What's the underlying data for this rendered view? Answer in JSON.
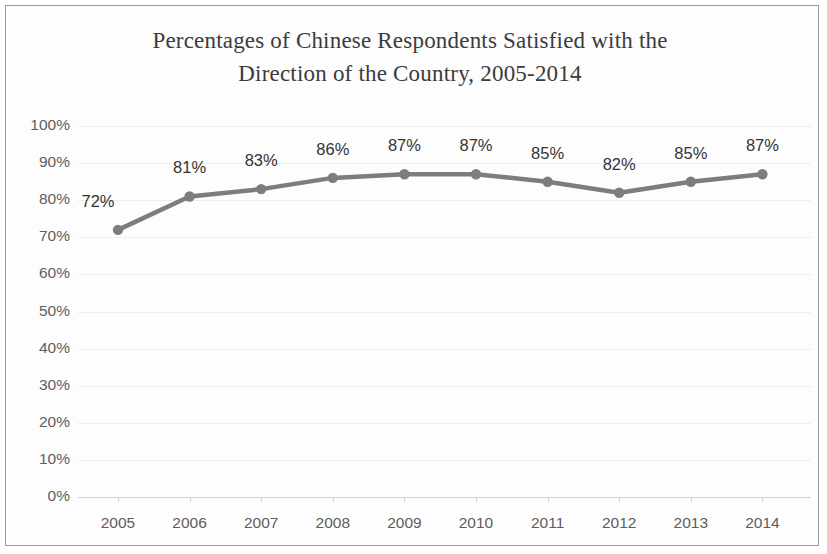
{
  "chart_data": {
    "type": "line",
    "title": "Percentages of Chinese Respondents Satisfied with the Direction of the Country, 2005-2014",
    "title_line1": "Percentages of Chinese Respondents Satisfied with the",
    "title_line2": "Direction of the Country, 2005-2014",
    "xlabel": "",
    "ylabel": "",
    "categories": [
      "2005",
      "2006",
      "2007",
      "2008",
      "2009",
      "2010",
      "2011",
      "2012",
      "2013",
      "2014"
    ],
    "values": [
      72,
      81,
      83,
      86,
      87,
      87,
      85,
      82,
      85,
      87
    ],
    "data_labels": [
      "72%",
      "81%",
      "83%",
      "86%",
      "87%",
      "87%",
      "85%",
      "82%",
      "85%",
      "87%"
    ],
    "ylim": [
      0,
      100
    ],
    "ytick_values": [
      100,
      90,
      80,
      70,
      60,
      50,
      40,
      30,
      20,
      10,
      0
    ],
    "ytick_labels": [
      "100%",
      "90%",
      "80%",
      "70%",
      "60%",
      "50%",
      "40%",
      "30%",
      "20%",
      "10%",
      "0%"
    ],
    "grid": true,
    "legend": false,
    "series_color": "#7d7d7d",
    "gridline_color": "#ededed",
    "axis_color": "#d2d2d2",
    "label_color": "#5e5e5e",
    "title_color": "#3b3b3b",
    "border_color": "#9a9a9a"
  }
}
